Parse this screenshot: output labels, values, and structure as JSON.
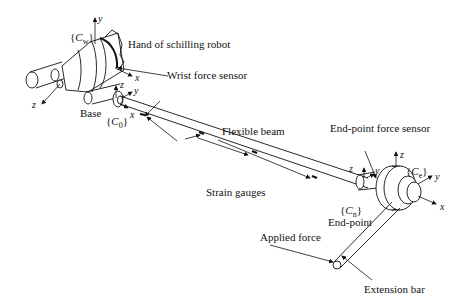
{
  "labels": {
    "hand": "Hand of schilling robot",
    "wrist_sensor": "Wrist force sensor",
    "base": "Base",
    "flexible_beam": "Flexible beam",
    "strain_gauges": "Strain gauges",
    "endpoint_sensor": "End-point force sensor",
    "endpoint": "End-point",
    "applied_force": "Applied force",
    "extension_bar": "Extension bar"
  },
  "frames": {
    "wrist": {
      "prefix": "{",
      "letter": "C",
      "sub": "w",
      "suffix": "}"
    },
    "base": {
      "prefix": "{",
      "letter": "C",
      "sub": "0",
      "suffix": "}"
    },
    "endpoint": {
      "prefix": "{",
      "letter": "C",
      "sub": "n",
      "suffix": "}"
    },
    "sensor": {
      "prefix": "{",
      "letter": "C",
      "sub": "e",
      "suffix": "}"
    }
  },
  "axes": {
    "wrist_y": "y",
    "wrist_x": "x",
    "wrist_z": "z",
    "base_z": "z",
    "base_y": "y",
    "base_x": "x",
    "end_z": "z",
    "end_y": "y",
    "sensor_z": "z",
    "sensor_y": "y",
    "sensor_x": "x"
  }
}
